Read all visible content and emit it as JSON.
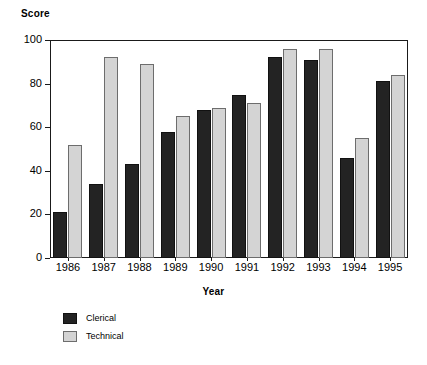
{
  "chart_data": {
    "type": "bar",
    "title": "",
    "xlabel": "Year",
    "ylabel": "Score",
    "categories": [
      "1986",
      "1987",
      "1988",
      "1989",
      "1990",
      "1991",
      "1992",
      "1993",
      "1994",
      "1995"
    ],
    "series": [
      {
        "name": "Clerical",
        "color": "#232323",
        "values": [
          21,
          34,
          43,
          58,
          68,
          75,
          92,
          91,
          46,
          81
        ]
      },
      {
        "name": "Technical",
        "color": "#d4d4d4",
        "values": [
          52,
          92,
          89,
          65,
          69,
          71,
          96,
          96,
          55,
          84
        ]
      }
    ],
    "ylim": [
      0,
      100
    ],
    "yticks": [
      0,
      20,
      40,
      60,
      80,
      100
    ],
    "ytick_labels": [
      "0",
      "20",
      "40",
      "60",
      "80",
      "100"
    ],
    "grid": false,
    "legend_position": "bottom-left",
    "frame": true
  },
  "axes": {
    "y_title": "Score",
    "x_title": "Year"
  },
  "legend": {
    "entries": [
      {
        "label": "Clerical",
        "swatch": "dark-swatch"
      },
      {
        "label": "Technical",
        "swatch": "light-swatch"
      }
    ]
  }
}
